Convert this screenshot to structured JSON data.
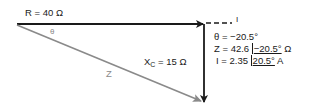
{
  "diagram": {
    "type": "impedance-phasor-diagram",
    "colors": {
      "resistance": "#1a1a1a",
      "reactance": "#1a1a1a",
      "impedance": "#8a8a8a",
      "current": "#1a1a1a"
    },
    "labels": {
      "resistance": "R = 40 Ω",
      "reactance_symbol": "X",
      "reactance_subscript": "C",
      "reactance_value": " = 15 Ω",
      "theta_symbol": "θ",
      "impedance_symbol": "Z",
      "current_symbol": "I"
    },
    "results": {
      "theta_line": "θ = −20.5°",
      "z_prefix": "Z = 42.6 ",
      "z_angle": "−20.5°",
      "z_unit": " Ω",
      "i_prefix": "I = 2.35 ",
      "i_angle": "20.5°",
      "i_unit": " A"
    },
    "values": {
      "R_ohm": 40,
      "XC_ohm": 15,
      "Z_ohm": 42.6,
      "theta_deg": -20.5,
      "I_amp": 2.35,
      "I_angle_deg": 20.5
    }
  }
}
